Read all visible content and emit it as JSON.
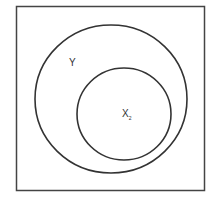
{
  "diagram": {
    "type": "venn",
    "universe": {
      "x": 16,
      "y": 6,
      "width": 189,
      "height": 185
    },
    "sets": [
      {
        "name": "Y",
        "label": "Y",
        "cx": 111,
        "cy": 99,
        "rx": 76,
        "ry": 74,
        "label_pos": {
          "x": 69,
          "y": 57
        }
      },
      {
        "name": "X2",
        "label": "X",
        "subscript": "2",
        "cx": 124,
        "cy": 114,
        "rx": 47,
        "ry": 46,
        "label_pos": {
          "x": 122,
          "y": 108
        }
      }
    ],
    "relationship": "X2 is a subset of Y",
    "stroke_color": "#333333"
  }
}
